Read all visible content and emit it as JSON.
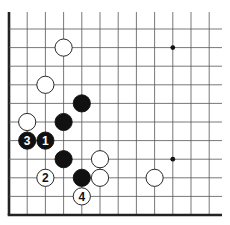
{
  "diagram": {
    "type": "go-board-fragment",
    "columns": 12,
    "rows": 11,
    "edges": [
      "left",
      "bottom"
    ],
    "colors": {
      "line": "#555555",
      "edge": "#222222",
      "black": "#111111",
      "white": "#ffffff"
    },
    "star_points": [
      {
        "col": 9,
        "row": 1
      },
      {
        "col": 9,
        "row": 7
      }
    ],
    "stones": [
      {
        "color": "white",
        "col": 3,
        "row": 1,
        "label": ""
      },
      {
        "color": "white",
        "col": 2,
        "row": 3,
        "label": ""
      },
      {
        "color": "black",
        "col": 4,
        "row": 4,
        "label": ""
      },
      {
        "color": "white",
        "col": 1,
        "row": 5,
        "label": ""
      },
      {
        "color": "black",
        "col": 3,
        "row": 5,
        "label": ""
      },
      {
        "color": "black",
        "col": 1,
        "row": 6,
        "label": "3"
      },
      {
        "color": "black",
        "col": 2,
        "row": 6,
        "label": "1"
      },
      {
        "color": "black",
        "col": 3,
        "row": 7,
        "label": ""
      },
      {
        "color": "white",
        "col": 5,
        "row": 7,
        "label": ""
      },
      {
        "color": "white",
        "col": 2,
        "row": 8,
        "label": "2"
      },
      {
        "color": "black",
        "col": 4,
        "row": 8,
        "label": ""
      },
      {
        "color": "white",
        "col": 5,
        "row": 8,
        "label": ""
      },
      {
        "color": "white",
        "col": 8,
        "row": 8,
        "label": ""
      },
      {
        "color": "white",
        "col": 4,
        "row": 9,
        "label": "4"
      }
    ]
  }
}
